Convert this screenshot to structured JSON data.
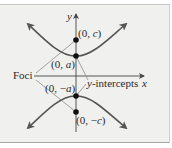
{
  "diagram": {
    "type": "hyperbola-vertical-transverse-axis",
    "axes": {
      "x_label": "x",
      "y_label": "y"
    },
    "points": {
      "focus_top": {
        "label_prefix": "(0, ",
        "var": "c",
        "label_suffix": ")"
      },
      "vertex_top": {
        "label_prefix": "(0, ",
        "var": "a",
        "label_suffix": ")"
      },
      "vertex_bottom": {
        "label_prefix": "(0, −",
        "var": "a",
        "label_suffix": ")"
      },
      "focus_bottom": {
        "label_prefix": "(0, −",
        "var": "c",
        "label_suffix": ")"
      }
    },
    "annotations": {
      "foci": "Foci",
      "y_intercepts_var": "y",
      "y_intercepts_rest": "-intercepts"
    },
    "colors": {
      "curve": "#555555",
      "axis": "#444444",
      "leader": "#8a8a8a",
      "dot": "#111111",
      "background": "#f0f0ee"
    }
  }
}
